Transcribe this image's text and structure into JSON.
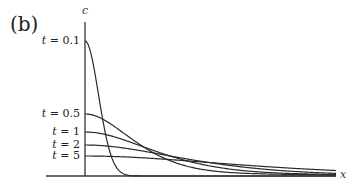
{
  "panel_label": "(b)",
  "chart_data": {
    "type": "line",
    "title": "",
    "xlabel": "x",
    "ylabel": "c",
    "grid": false,
    "legend": "inline labels on left of c-axis",
    "series": [
      {
        "name": "t = 0.1",
        "label_t": "t",
        "label_val": "= 0.1",
        "peak_y_px": 41,
        "spread_px": 24,
        "shape": "narrow"
      },
      {
        "name": "t = 0.5",
        "label_t": "t",
        "label_val": "= 0.5",
        "peak_y_px": 114,
        "spread_px": 55
      },
      {
        "name": "t = 1",
        "label_t": "t",
        "label_val": "= 1",
        "peak_y_px": 132,
        "spread_px": 78
      },
      {
        "name": "t = 2",
        "label_t": "t",
        "label_val": "= 2",
        "peak_y_px": 145,
        "spread_px": 110
      },
      {
        "name": "t = 5",
        "label_t": "t",
        "label_val": "= 5",
        "peak_y_px": 156,
        "spread_px": 170
      }
    ]
  }
}
